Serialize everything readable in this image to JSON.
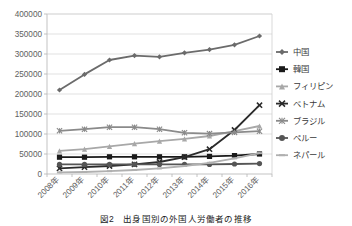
{
  "caption": "図2　出身国別の外国人労働者の推移",
  "chart_data": {
    "type": "line",
    "title": "",
    "xlabel": "",
    "ylabel": "",
    "ylim": [
      0,
      400000
    ],
    "ytick_step": 50000,
    "grid": true,
    "legend_position": "right",
    "categories": [
      "2008年",
      "2009年",
      "2010年",
      "2011年",
      "2012年",
      "2013年",
      "2014年",
      "2015年",
      "2016年"
    ],
    "ytick_labels": [
      "0",
      "50000",
      "100000",
      "150000",
      "200000",
      "250000",
      "300000",
      "350000",
      "400000"
    ],
    "series": [
      {
        "name": "中国",
        "marker": "diamond",
        "color": "#6b6b6b",
        "values": [
          210000,
          249000,
          285000,
          296000,
          293000,
          303000,
          311000,
          323000,
          345000
        ]
      },
      {
        "name": "韓国",
        "marker": "square",
        "color": "#1a1a1a",
        "values": [
          42000,
          42000,
          43000,
          43000,
          43000,
          43000,
          44000,
          46000,
          50000
        ]
      },
      {
        "name": "フィリピン",
        "marker": "triangle",
        "color": "#a8a8a8",
        "values": [
          58000,
          62000,
          69000,
          76000,
          82000,
          88000,
          95000,
          107000,
          120000
        ]
      },
      {
        "name": "ベトナム",
        "marker": "cross",
        "color": "#2b2b2b",
        "values": [
          14000,
          17000,
          20000,
          24000,
          30000,
          42000,
          62000,
          110000,
          172000
        ]
      },
      {
        "name": "ブラジル",
        "marker": "asterisk",
        "color": "#8a8a8a",
        "values": [
          108000,
          112000,
          117000,
          117000,
          112000,
          103000,
          101000,
          104000,
          107000
        ]
      },
      {
        "name": "ペルー",
        "marker": "circle",
        "color": "#555555",
        "values": [
          24000,
          24000,
          24000,
          24000,
          24000,
          24000,
          24000,
          25000,
          26000
        ]
      },
      {
        "name": "ネパール",
        "marker": "dash",
        "color": "#b0b0b0",
        "values": [
          4000,
          5000,
          7000,
          10000,
          14000,
          20000,
          28000,
          39000,
          52000
        ]
      }
    ]
  }
}
